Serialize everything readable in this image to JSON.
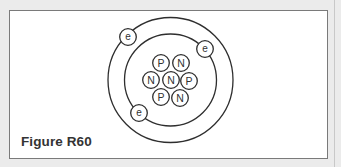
{
  "figure": {
    "label": "Figure R60",
    "colors": {
      "background": "#ebebeb",
      "panel": "#ffffff",
      "border": "#7a7a7a",
      "stroke": "#2e2e2e",
      "label_text": "#333333"
    }
  },
  "atom": {
    "orbits": [
      {
        "name": "inner-shell",
        "cx": 170.5,
        "cy": 80,
        "r": 46
      },
      {
        "name": "outer-shell",
        "cx": 170.5,
        "cy": 80,
        "r": 62.5
      }
    ],
    "nucleus": [
      {
        "type": "proton",
        "symbol": "P",
        "cx": 161,
        "cy": 63
      },
      {
        "type": "neutron",
        "symbol": "N",
        "cx": 181,
        "cy": 63
      },
      {
        "type": "neutron",
        "symbol": "N",
        "cx": 151,
        "cy": 80
      },
      {
        "type": "neutron",
        "symbol": "N",
        "cx": 171,
        "cy": 80
      },
      {
        "type": "proton",
        "symbol": "P",
        "cx": 189,
        "cy": 81
      },
      {
        "type": "proton",
        "symbol": "P",
        "cx": 161,
        "cy": 97
      },
      {
        "type": "neutron",
        "symbol": "N",
        "cx": 180,
        "cy": 98
      }
    ],
    "electrons": [
      {
        "symbol": "e",
        "cx": 128,
        "cy": 37
      },
      {
        "symbol": "e",
        "cx": 205,
        "cy": 49
      },
      {
        "symbol": "e",
        "cx": 139,
        "cy": 113
      }
    ],
    "particle_radius": 8.3,
    "electron_radius": 8.3
  }
}
